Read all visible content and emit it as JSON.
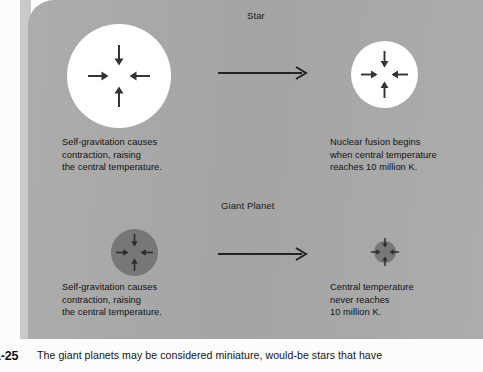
{
  "figure": {
    "number": "1-25",
    "caption_line_1": "The giant planets may be considered miniature, would-be stars that have",
    "caption_line_2": "too little mass to have proper temperature. Although they just about managed to raise their central",
    "caption": "The giant planets may be considered miniature, would-be stars that have"
  },
  "panel": {
    "background_color": "#a9a9a9",
    "gutter_color": "#c9c9c9"
  },
  "rows": {
    "star": {
      "heading": "Star",
      "circle_color": "#ffffff",
      "before": {
        "caption": "Self-gravitation causes\ncontraction, raising\nthe central temperature."
      },
      "after": {
        "caption": "Nuclear fusion begins\nwhen central temperature\nreaches 10 million K."
      }
    },
    "giant_planet": {
      "heading": "Giant Planet",
      "circle_color": "#777777",
      "before": {
        "caption": "Self-gravitation causes\ncontraction, raising\nthe central temperature."
      },
      "after": {
        "caption": "Central temperature\nnever reaches\n10 million K."
      }
    }
  },
  "icons": {
    "contraction_arrows": "inward-arrows-icon",
    "transition": "right-arrow-icon"
  }
}
